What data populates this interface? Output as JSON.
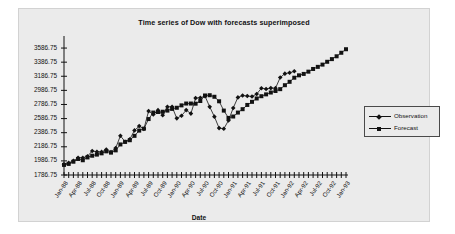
{
  "chart_data": {
    "type": "line",
    "title": "Time series of Dow with forecasts superimposed",
    "xlabel": "Date",
    "ylabel": "",
    "ylim": [
      1786.75,
      3686.75
    ],
    "ytick_labels": [
      "1786.75",
      "1986.75",
      "2186.75",
      "2386.75",
      "2586.75",
      "2786.75",
      "2986.75",
      "3186.75",
      "3386.75",
      "3586.75"
    ],
    "ytick_values": [
      1786.75,
      1986.75,
      2186.75,
      2386.75,
      2586.75,
      2786.75,
      2986.75,
      3186.75,
      3386.75,
      3586.75
    ],
    "grid": false,
    "legend_position": "right",
    "x_tick_count": 61,
    "x_tick_labels": [
      "Jan-88",
      "Apr-88",
      "Jul-88",
      "Oct-88",
      "Jan-89",
      "Apr-89",
      "Jul-89",
      "Oct-89",
      "Jan-90",
      "Apr-90",
      "Jul-90",
      "Oct-90",
      "Jan-91",
      "Apr-91",
      "Jul-91",
      "Oct-91",
      "Jan-92",
      "Apr-92",
      "Jul-92",
      "Oct-92",
      "Jan-93"
    ],
    "x_tick_label_interval": 3,
    "series": [
      {
        "name": "Observation",
        "marker": "diamond",
        "color": "#121212",
        "values": [
          1938,
          1958,
          1988,
          2032,
          2031,
          2052,
          2128,
          2115,
          2114,
          2148,
          2112,
          2169,
          2342,
          2259,
          2294,
          2419,
          2480,
          2440,
          2693,
          2645,
          2706,
          2634,
          2753,
          2753,
          2590,
          2627,
          2707,
          2657,
          2877,
          2881,
          2905,
          2753,
          2614,
          2452,
          2442,
          2560,
          2736,
          2887,
          2913,
          2906,
          2899,
          2935,
          3017,
          3006,
          3019,
          3018,
          3169,
          3224,
          3236,
          3257
        ]
      },
      {
        "name": "Forecast",
        "marker": "square",
        "color": "#121212",
        "values": [
          1930,
          1944,
          1975,
          2014,
          1996,
          2036,
          2060,
          2076,
          2094,
          2122,
          2104,
          2136,
          2220,
          2256,
          2280,
          2342,
          2416,
          2444,
          2580,
          2672,
          2680,
          2684,
          2700,
          2724,
          2740,
          2774,
          2800,
          2800,
          2798,
          2836,
          2914,
          2918,
          2896,
          2832,
          2700,
          2596,
          2616,
          2672,
          2720,
          2780,
          2824,
          2872,
          2904,
          2930,
          2956,
          2978,
          3004,
          3060,
          3108,
          3166,
          3200,
          3220,
          3252,
          3290,
          3320,
          3352,
          3392,
          3430,
          3470,
          3520,
          3570
        ]
      }
    ]
  },
  "legend": {
    "items": [
      {
        "label": "Observation"
      },
      {
        "label": "Forecast"
      }
    ]
  }
}
